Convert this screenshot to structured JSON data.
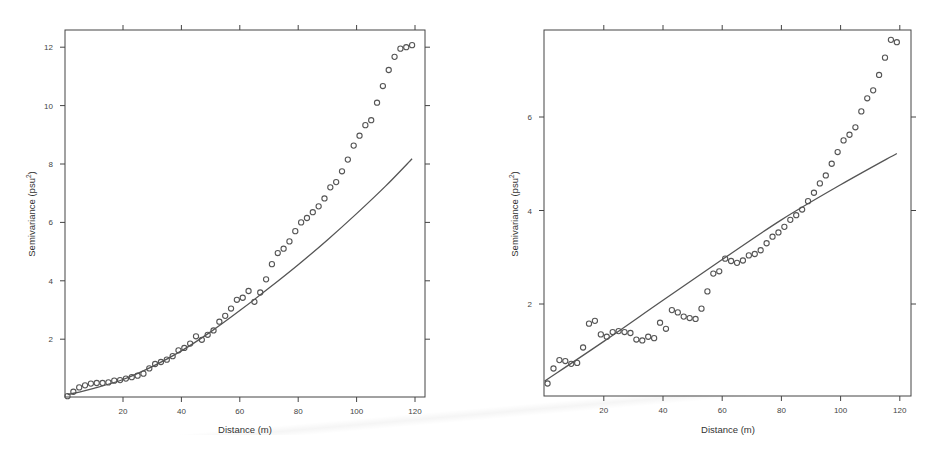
{
  "chart_data": [
    {
      "type": "scatter",
      "title": "",
      "xlabel": "Distance (m)",
      "ylabel": "Semivariance (psu²)",
      "xlim": [
        0,
        124
      ],
      "ylim": [
        0,
        12.6
      ],
      "x_ticks": [
        20,
        40,
        60,
        80,
        100,
        120
      ],
      "y_ticks": [
        2,
        4,
        6,
        8,
        10,
        12
      ],
      "grid": false,
      "legend": null,
      "series": [
        {
          "name": "empirical semivariance",
          "style": "open-circles",
          "x": [
            1,
            3,
            5,
            7,
            9,
            11,
            13,
            15,
            17,
            19,
            21,
            23,
            25,
            27,
            29,
            31,
            33,
            35,
            37,
            39,
            41,
            43,
            45,
            47,
            49,
            51,
            53,
            55,
            57,
            59,
            61,
            63,
            65,
            67,
            69,
            71,
            73,
            75,
            77,
            79,
            81,
            83,
            85,
            87,
            89,
            91,
            93,
            95,
            97,
            99,
            101,
            103,
            105,
            107,
            109,
            111,
            113,
            115,
            117,
            119
          ],
          "values": [
            0.05,
            0.2,
            0.35,
            0.42,
            0.48,
            0.5,
            0.5,
            0.52,
            0.58,
            0.6,
            0.65,
            0.7,
            0.75,
            0.82,
            1.0,
            1.15,
            1.22,
            1.3,
            1.42,
            1.62,
            1.7,
            1.85,
            2.1,
            1.98,
            2.15,
            2.3,
            2.6,
            2.8,
            3.05,
            3.35,
            3.42,
            3.65,
            3.28,
            3.6,
            4.05,
            4.57,
            4.95,
            5.1,
            5.35,
            5.7,
            6.0,
            6.15,
            6.35,
            6.55,
            6.82,
            7.2,
            7.38,
            7.75,
            8.15,
            8.63,
            8.97,
            9.33,
            9.5,
            10.1,
            10.67,
            11.22,
            11.67,
            11.95,
            12.0,
            12.07
          ]
        },
        {
          "name": "fitted model",
          "style": "line",
          "x": [
            1,
            10,
            20,
            30,
            40,
            50,
            60,
            70,
            80,
            90,
            100,
            110,
            119
          ],
          "values": [
            0.1,
            0.32,
            0.62,
            1.06,
            1.6,
            2.25,
            2.98,
            3.75,
            4.55,
            5.4,
            6.3,
            7.25,
            8.18
          ]
        }
      ]
    },
    {
      "type": "scatter",
      "title": "",
      "xlabel": "Distance (m)",
      "ylabel": "Semivariance (psu²)",
      "xlim": [
        0,
        124
      ],
      "ylim": [
        0,
        7.8
      ],
      "x_ticks": [
        20,
        40,
        60,
        80,
        100,
        120
      ],
      "y_ticks": [
        2,
        4,
        6
      ],
      "grid": false,
      "legend": null,
      "series": [
        {
          "name": "empirical semivariance",
          "style": "open-circles",
          "x": [
            1,
            3,
            5,
            7,
            9,
            11,
            13,
            15,
            17,
            19,
            21,
            23,
            25,
            27,
            29,
            31,
            33,
            35,
            37,
            39,
            41,
            43,
            45,
            47,
            49,
            51,
            53,
            55,
            57,
            59,
            61,
            63,
            65,
            67,
            69,
            71,
            73,
            75,
            77,
            79,
            81,
            83,
            85,
            87,
            89,
            91,
            93,
            95,
            97,
            99,
            101,
            103,
            105,
            107,
            109,
            111,
            113,
            115,
            117,
            119
          ],
          "values": [
            0.3,
            0.62,
            0.8,
            0.78,
            0.72,
            0.74,
            1.07,
            1.58,
            1.64,
            1.35,
            1.3,
            1.4,
            1.42,
            1.4,
            1.38,
            1.24,
            1.22,
            1.3,
            1.27,
            1.6,
            1.47,
            1.87,
            1.82,
            1.73,
            1.7,
            1.68,
            1.9,
            2.27,
            2.65,
            2.7,
            2.97,
            2.92,
            2.88,
            2.93,
            3.04,
            3.07,
            3.15,
            3.3,
            3.44,
            3.53,
            3.65,
            3.8,
            3.9,
            4.02,
            4.2,
            4.38,
            4.58,
            4.75,
            5.0,
            5.25,
            5.5,
            5.62,
            5.78,
            6.12,
            6.4,
            6.57,
            6.9,
            7.27,
            7.65,
            7.6
          ]
        },
        {
          "name": "fitted model",
          "style": "line",
          "x": [
            0,
            20,
            40,
            60,
            80,
            100,
            119
          ],
          "values": [
            0.35,
            1.2,
            2.08,
            2.95,
            3.8,
            4.55,
            5.22
          ]
        }
      ]
    }
  ],
  "panels": {
    "left": {
      "xlabel": "Distance (m)",
      "ylabel": "Semivariance (psu²)",
      "x_tick_labels": [
        "20",
        "40",
        "60",
        "80",
        "100",
        "120"
      ],
      "y_tick_labels": [
        "2",
        "4",
        "6",
        "8",
        "10",
        "12"
      ]
    },
    "right": {
      "xlabel": "Distance (m)",
      "ylabel": "Semivariance (psu²)",
      "x_tick_labels": [
        "20",
        "40",
        "60",
        "80",
        "100",
        "120"
      ],
      "y_tick_labels": [
        "2",
        "4",
        "6"
      ]
    }
  },
  "colors": {
    "ink": "#444444",
    "points": "#555555",
    "background": "#ffffff"
  }
}
